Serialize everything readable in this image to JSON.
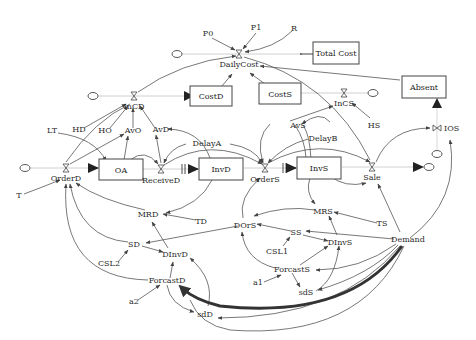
{
  "diagram": {
    "type": "stock-and-flow",
    "stocks": [
      {
        "id": "total_cost",
        "label": "Total Cost"
      },
      {
        "id": "costd",
        "label": "CostD"
      },
      {
        "id": "costs",
        "label": "CostS"
      },
      {
        "id": "absent",
        "label": "Absent"
      },
      {
        "id": "oa",
        "label": "OA"
      },
      {
        "id": "invd",
        "label": "InvD"
      },
      {
        "id": "invs",
        "label": "InvS"
      }
    ],
    "flows": [
      {
        "id": "dailycost",
        "label": "DailyCost"
      },
      {
        "id": "incd",
        "label": "InCD"
      },
      {
        "id": "incs",
        "label": "InCS"
      },
      {
        "id": "orderd",
        "label": "OrderD"
      },
      {
        "id": "received",
        "label": "ReceiveD"
      },
      {
        "id": "orders",
        "label": "OrderS"
      },
      {
        "id": "sale",
        "label": "Sale"
      },
      {
        "id": "ios",
        "label": "IOS"
      }
    ],
    "variables": [
      {
        "id": "p0",
        "label": "P0"
      },
      {
        "id": "p1",
        "label": "P1"
      },
      {
        "id": "r",
        "label": "R"
      },
      {
        "id": "lt",
        "label": "LT"
      },
      {
        "id": "hd",
        "label": "HD"
      },
      {
        "id": "ho",
        "label": "HO"
      },
      {
        "id": "avo",
        "label": "AvO"
      },
      {
        "id": "avd",
        "label": "AvD"
      },
      {
        "id": "delaya",
        "label": "DelayA"
      },
      {
        "id": "avs",
        "label": "AvS"
      },
      {
        "id": "delayb",
        "label": "DelayB"
      },
      {
        "id": "hs",
        "label": "HS"
      },
      {
        "id": "t",
        "label": "T"
      },
      {
        "id": "mrd",
        "label": "MRD"
      },
      {
        "id": "td",
        "label": "TD"
      },
      {
        "id": "mrs",
        "label": "MRS"
      },
      {
        "id": "ts",
        "label": "TS"
      },
      {
        "id": "dors",
        "label": "DOrS"
      },
      {
        "id": "ss",
        "label": "SS"
      },
      {
        "id": "dinvs",
        "label": "DInvS"
      },
      {
        "id": "csl1",
        "label": "CSL1"
      },
      {
        "id": "demand",
        "label": "Demand"
      },
      {
        "id": "sd",
        "label": "SD"
      },
      {
        "id": "dinvd",
        "label": "DInvD"
      },
      {
        "id": "csl2",
        "label": "CSL2"
      },
      {
        "id": "forcasts",
        "label": "ForcastS"
      },
      {
        "id": "a1",
        "label": "a1"
      },
      {
        "id": "sds",
        "label": "sdS"
      },
      {
        "id": "forcastd",
        "label": "ForcastD"
      },
      {
        "id": "a2",
        "label": "a2"
      },
      {
        "id": "sdd",
        "label": "sdD"
      }
    ]
  }
}
